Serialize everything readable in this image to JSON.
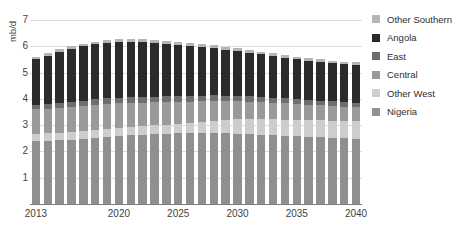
{
  "chart_data": {
    "type": "bar",
    "stacked": true,
    "title": "Scenario",
    "xlabel": "",
    "ylabel": "mb/d",
    "ylim": [
      0,
      7
    ],
    "yticks": [
      1,
      2,
      3,
      4,
      5,
      6,
      7
    ],
    "grid": true,
    "legend_position": "right",
    "categories": [
      "2013",
      "2014",
      "2015",
      "2016",
      "2017",
      "2018",
      "2019",
      "2020",
      "2021",
      "2022",
      "2023",
      "2024",
      "2025",
      "2026",
      "2027",
      "2028",
      "2029",
      "2030",
      "2031",
      "2032",
      "2033",
      "2034",
      "2035",
      "2036",
      "2037",
      "2038",
      "2039",
      "2040"
    ],
    "xtick_labels": [
      "2013",
      "2020",
      "2025",
      "2030",
      "2035",
      "2040"
    ],
    "xtick_categories": [
      "2013",
      "2020",
      "2025",
      "2030",
      "2035",
      "2040"
    ],
    "series": [
      {
        "name": "Nigeria",
        "color": "#8f8f8f",
        "values": [
          2.38,
          2.4,
          2.42,
          2.45,
          2.48,
          2.52,
          2.56,
          2.6,
          2.62,
          2.64,
          2.66,
          2.68,
          2.7,
          2.7,
          2.7,
          2.7,
          2.69,
          2.68,
          2.66,
          2.64,
          2.62,
          2.6,
          2.58,
          2.56,
          2.54,
          2.52,
          2.5,
          2.48
        ]
      },
      {
        "name": "Other West",
        "color": "#cdcdcd",
        "values": [
          0.3,
          0.3,
          0.3,
          0.3,
          0.3,
          0.3,
          0.3,
          0.3,
          0.31,
          0.32,
          0.33,
          0.34,
          0.35,
          0.38,
          0.42,
          0.46,
          0.5,
          0.54,
          0.56,
          0.58,
          0.6,
          0.61,
          0.62,
          0.63,
          0.64,
          0.65,
          0.66,
          0.67
        ]
      },
      {
        "name": "Central",
        "color": "#9a9a9a",
        "values": [
          0.92,
          0.93,
          0.94,
          0.95,
          0.95,
          0.95,
          0.94,
          0.93,
          0.92,
          0.9,
          0.88,
          0.86,
          0.84,
          0.82,
          0.79,
          0.76,
          0.73,
          0.7,
          0.68,
          0.66,
          0.64,
          0.62,
          0.6,
          0.58,
          0.57,
          0.56,
          0.55,
          0.54
        ]
      },
      {
        "name": "East",
        "color": "#6e6e6e",
        "values": [
          0.16,
          0.17,
          0.18,
          0.19,
          0.2,
          0.21,
          0.22,
          0.22,
          0.22,
          0.22,
          0.22,
          0.22,
          0.22,
          0.21,
          0.21,
          0.21,
          0.2,
          0.2,
          0.2,
          0.19,
          0.19,
          0.19,
          0.18,
          0.18,
          0.18,
          0.18,
          0.17,
          0.17
        ]
      },
      {
        "name": "Angola",
        "color": "#2b2b2b",
        "values": [
          1.74,
          1.85,
          1.95,
          2.02,
          2.07,
          2.1,
          2.12,
          2.12,
          2.1,
          2.07,
          2.03,
          1.99,
          1.95,
          1.9,
          1.85,
          1.8,
          1.75,
          1.7,
          1.66,
          1.62,
          1.58,
          1.55,
          1.52,
          1.5,
          1.48,
          1.46,
          1.45,
          1.44
        ]
      },
      {
        "name": "Other Southern",
        "color": "#b5b5b5",
        "values": [
          0.08,
          0.08,
          0.09,
          0.09,
          0.1,
          0.1,
          0.11,
          0.11,
          0.11,
          0.11,
          0.11,
          0.11,
          0.11,
          0.11,
          0.11,
          0.11,
          0.1,
          0.1,
          0.1,
          0.1,
          0.1,
          0.1,
          0.1,
          0.1,
          0.09,
          0.09,
          0.09,
          0.09
        ]
      }
    ],
    "legend_order": [
      "Other Southern",
      "Angola",
      "East",
      "Central",
      "Other West",
      "Nigeria"
    ]
  }
}
